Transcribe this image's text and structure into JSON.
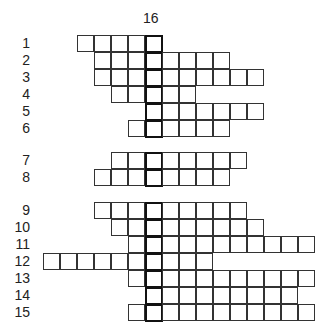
{
  "puzzle": {
    "vertical_clue_number": "16",
    "highlight_column": 4,
    "rows": [
      {
        "number": "1",
        "start": 0,
        "end": 4,
        "y": 35
      },
      {
        "number": "2",
        "start": 1,
        "end": 8,
        "y": 52
      },
      {
        "number": "3",
        "start": 1,
        "end": 10,
        "y": 69
      },
      {
        "number": "4",
        "start": 2,
        "end": 6,
        "y": 86
      },
      {
        "number": "5",
        "start": 4,
        "end": 10,
        "y": 103
      },
      {
        "number": "6",
        "start": 3,
        "end": 8,
        "y": 120
      },
      {
        "number": "7",
        "start": 2,
        "end": 9,
        "y": 152
      },
      {
        "number": "8",
        "start": 1,
        "end": 8,
        "y": 169
      },
      {
        "number": "9",
        "start": 1,
        "end": 9,
        "y": 202
      },
      {
        "number": "10",
        "start": 2,
        "end": 10,
        "y": 219
      },
      {
        "number": "11",
        "start": 3,
        "end": 13,
        "y": 236
      },
      {
        "number": "12",
        "start": -2,
        "end": 7,
        "y": 253
      },
      {
        "number": "13",
        "start": 3,
        "end": 13,
        "y": 270
      },
      {
        "number": "14",
        "start": 4,
        "end": 12,
        "y": 287
      },
      {
        "number": "15",
        "start": 3,
        "end": 13,
        "y": 304
      }
    ]
  }
}
